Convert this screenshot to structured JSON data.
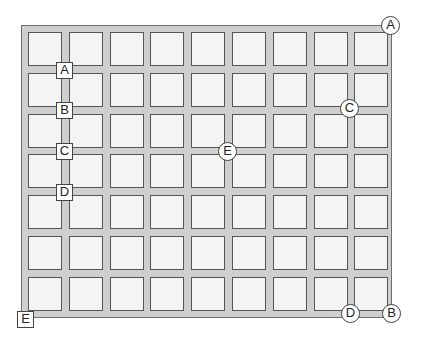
{
  "diagram": {
    "grid": {
      "columns": 9,
      "rows": 7
    },
    "colors": {
      "frame": "#cfcfcf",
      "cell": "#f4f4f4",
      "outline": "#555555"
    },
    "square_labels": [
      {
        "text": "A",
        "x": 64,
        "y": 70
      },
      {
        "text": "B",
        "x": 64,
        "y": 110
      },
      {
        "text": "C",
        "x": 64,
        "y": 151
      },
      {
        "text": "D",
        "x": 64,
        "y": 192
      },
      {
        "text": "E",
        "x": 25,
        "y": 319
      }
    ],
    "circle_labels": [
      {
        "text": "A",
        "x": 390,
        "y": 25
      },
      {
        "text": "C",
        "x": 349,
        "y": 108
      },
      {
        "text": "E",
        "x": 227,
        "y": 151
      },
      {
        "text": "D",
        "x": 350,
        "y": 313
      },
      {
        "text": "B",
        "x": 391,
        "y": 313
      }
    ]
  }
}
